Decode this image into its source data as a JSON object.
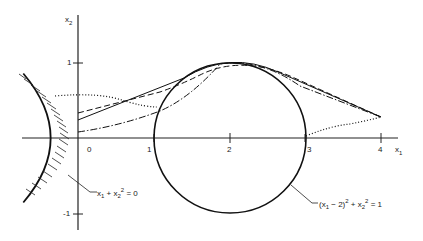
{
  "figure": {
    "axes": {
      "x_label": "x",
      "x_label_sub": "1",
      "y_label": "x",
      "y_label_sub": "2",
      "x_ticks": [
        "0",
        "1",
        "2",
        "3",
        "4"
      ],
      "y_ticks": [
        "1",
        "-1"
      ]
    },
    "annotations": {
      "parabola": {
        "pre": "x",
        "s1": "1",
        "mid": " + x",
        "sub2": "2",
        "sup2": "2",
        "post": " = 0"
      },
      "circle": {
        "pre": "(x",
        "s1": "1",
        "mid": " − 2)",
        "sup1": "2",
        "mid2": " + x",
        "sub2": "2",
        "sup2": "2",
        "post": " = 1"
      }
    },
    "curves": [
      {
        "name": "constraint-parabola",
        "equation": "x1 + x2^2 = 0",
        "style": "solid hatched"
      },
      {
        "name": "constraint-circle",
        "equation": "(x1-2)^2 + x2^2 = 1",
        "style": "solid"
      },
      {
        "name": "path-solid",
        "style": "solid"
      },
      {
        "name": "path-dashed",
        "style": "dashed"
      },
      {
        "name": "path-dashdot",
        "style": "dash-dot"
      },
      {
        "name": "path-dotted",
        "style": "dotted"
      }
    ],
    "endpoint": {
      "x1": 4,
      "x2": 0.28
    }
  }
}
